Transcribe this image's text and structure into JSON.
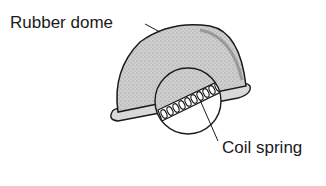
{
  "diagram": {
    "labels": {
      "rubber_dome": "Rubber dome",
      "coil_spring": "Coil spring"
    },
    "colors": {
      "dome_fill": "#c8c8c8",
      "outline": "#1a1a1a",
      "background": "#ffffff"
    }
  }
}
